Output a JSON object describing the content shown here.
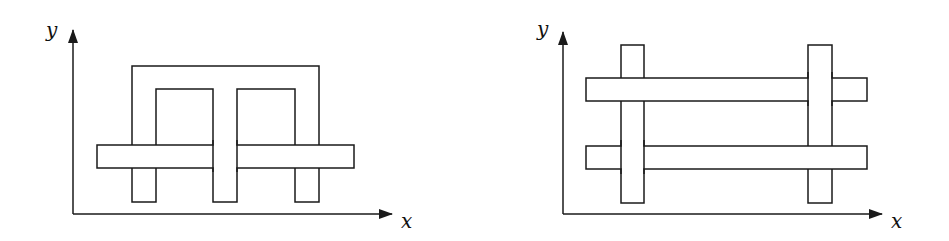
{
  "figures": [
    {
      "id": "left",
      "description": "Interlocking frame: an inverted-U shaped band whose legs and a central stem pass through a single horizontal bar",
      "axes": {
        "x_label": "x",
        "y_label": "y",
        "origin": [
          73,
          214
        ],
        "x_arrow_tip": [
          392,
          214
        ],
        "y_arrow_tip": [
          73,
          30
        ]
      },
      "shapes": {
        "frame_outer": {
          "left": 132,
          "right": 319,
          "top": 66
        },
        "frame_inner_left": {
          "left": 156,
          "right": 213,
          "top": 89
        },
        "frame_inner_right": {
          "left": 237,
          "right": 295,
          "top": 89
        },
        "legs_bottom": 202,
        "horizontal_bar": {
          "left": 97,
          "right": 354,
          "top": 145,
          "bottom": 168
        }
      },
      "overlaps": [
        {
          "over": "horizontal_bar",
          "under": "left_leg"
        },
        {
          "over": "center_stem",
          "under": "horizontal_bar"
        },
        {
          "over": "horizontal_bar",
          "under": "right_leg"
        }
      ]
    },
    {
      "id": "right",
      "description": "Woven grid: two vertical bars and two horizontal bars alternating over and under",
      "axes": {
        "x_label": "x",
        "y_label": "y",
        "origin": [
          563,
          214
        ],
        "x_arrow_tip": [
          882,
          214
        ],
        "y_arrow_tip": [
          563,
          32
        ]
      },
      "shapes": {
        "vertical_left": {
          "left": 621,
          "right": 644,
          "top": 45,
          "bottom": 203
        },
        "vertical_right": {
          "left": 808,
          "right": 832,
          "top": 45,
          "bottom": 203
        },
        "horizontal_top": {
          "left": 586,
          "right": 867,
          "top": 78,
          "bottom": 101
        },
        "horizontal_bottom": {
          "left": 586,
          "right": 867,
          "top": 146,
          "bottom": 169
        }
      },
      "overlaps": [
        {
          "over": "horizontal_top",
          "under": "vertical_left"
        },
        {
          "over": "vertical_right",
          "under": "horizontal_top"
        },
        {
          "over": "vertical_left",
          "under": "horizontal_bottom"
        },
        {
          "over": "horizontal_bottom",
          "under": "vertical_right"
        }
      ]
    }
  ],
  "colors": {
    "stroke": "#1a1a1a",
    "fill": "#ffffff",
    "background": "#ffffff"
  }
}
